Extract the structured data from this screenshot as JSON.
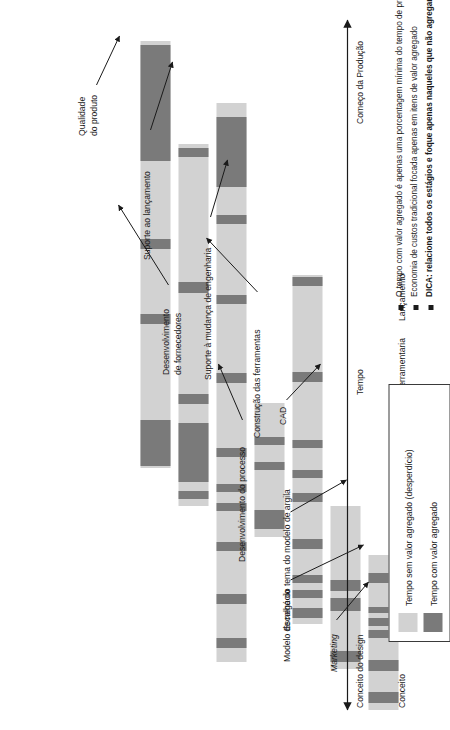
{
  "chart_data": {
    "type": "bar",
    "title": "",
    "xlabel": "Tempo",
    "ylabel": "",
    "orientation": "horizontal-timeline",
    "axis": {
      "left_label": "Conceito do design",
      "middle_label": "Tempo",
      "right_label": "Começo da Produção",
      "double_headed": true
    },
    "categories": [
      "Conceito",
      "Estilo",
      "Projeto com CAD",
      "Protótipo",
      "Engenharia de produção",
      "Ferramentaria",
      "Lançamento"
    ],
    "legend": {
      "position": "bottom-right",
      "entries": [
        {
          "label": "Tempo sem valor agregado (desperdício)",
          "color": "#d2d2d2"
        },
        {
          "label": "Tempo com valor agregado",
          "color": "#7a7a7a"
        }
      ]
    },
    "series": [
      {
        "name": "Tempo sem valor agregado (desperdício)",
        "color": "#d2d2d2"
      },
      {
        "name": "Tempo com valor agregado",
        "color": "#7a7a7a"
      }
    ],
    "bars": [
      {
        "category": "Conceito",
        "start_pct": 0.0,
        "end_pct": 22.5,
        "value_added_segments_pct": [
          [
            1.0,
            2.6
          ],
          [
            5.6,
            7.2
          ],
          [
            10.4,
            11.6
          ],
          [
            12.2,
            13.4
          ],
          [
            14.0,
            15.0
          ],
          [
            18.4,
            19.8
          ]
        ]
      },
      {
        "category": "Estilo",
        "start_pct": 6.0,
        "end_pct": 29.5,
        "value_added_segments_pct": [
          [
            7.0,
            8.6
          ],
          [
            14.4,
            16.2
          ],
          [
            17.2,
            18.8
          ]
        ]
      },
      {
        "category": "Projeto com CAD",
        "start_pct": 12.5,
        "end_pct": 63.0,
        "value_added_segments_pct": [
          [
            13.4,
            14.8
          ],
          [
            16.2,
            17.4
          ],
          [
            18.4,
            19.6
          ],
          [
            23.4,
            24.8
          ],
          [
            30.2,
            31.4
          ],
          [
            33.6,
            34.8
          ],
          [
            38.0,
            39.2
          ],
          [
            47.6,
            49.0
          ],
          [
            61.4,
            62.8
          ]
        ]
      },
      {
        "category": "Protótipo",
        "start_pct": 25.0,
        "end_pct": 44.5,
        "value_added_segments_pct": [
          [
            26.2,
            29.0
          ],
          [
            34.8,
            36.0
          ],
          [
            38.4,
            39.6
          ]
        ]
      },
      {
        "category": "Engenharia de produção",
        "start_pct": 7.0,
        "end_pct": 88.0,
        "value_added_segments_pct": [
          [
            9.0,
            10.4
          ],
          [
            15.4,
            16.8
          ],
          [
            23.0,
            24.4
          ],
          [
            28.8,
            30.0
          ],
          [
            31.6,
            32.8
          ],
          [
            36.6,
            38.0
          ],
          [
            47.4,
            48.8
          ],
          [
            58.8,
            60.2
          ],
          [
            70.4,
            71.8
          ],
          [
            75.8,
            86.0
          ]
        ]
      },
      {
        "category": "Ferramentaria",
        "start_pct": 29.5,
        "end_pct": 82.0,
        "value_added_segments_pct": [
          [
            30.6,
            31.8
          ],
          [
            33.0,
            41.6
          ],
          [
            44.4,
            45.8
          ],
          [
            60.4,
            62.0
          ],
          [
            80.2,
            81.4
          ]
        ]
      },
      {
        "category": "Lançamento",
        "start_pct": 35.0,
        "end_pct": 97.0,
        "value_added_segments_pct": [
          [
            35.4,
            42.0
          ],
          [
            56.0,
            57.4
          ],
          [
            66.8,
            68.2
          ],
          [
            79.6,
            96.4
          ]
        ]
      }
    ],
    "annotations": [
      {
        "text": "Marketing",
        "italic": true,
        "points_to": "Conceito"
      },
      {
        "text": "Modelo de negócio",
        "italic": false,
        "points_to": "Conceito"
      },
      {
        "text": "Escolha do tema do modelo de argila",
        "italic": false,
        "points_to": "Estilo"
      },
      {
        "text": "CAD",
        "italic": false,
        "points_to": "Projeto com CAD"
      },
      {
        "text": "Suporte à mudança de engenharia",
        "italic": false,
        "points_to": "Projeto com CAD"
      },
      {
        "text": "Suporte ao lançamento",
        "italic": false,
        "points_to": "Engenharia de produção"
      },
      {
        "text": "Qualidade do produto",
        "italic": false,
        "points_to": "Lançamento"
      },
      {
        "text": "Desenvolvimento de fornecedores",
        "italic": false,
        "points_to": "Engenharia de produção"
      },
      {
        "text": "Desenvolvimento do processo",
        "italic": false,
        "points_to": "Engenharia de produção"
      },
      {
        "text": "Construção das ferramentas",
        "italic": false,
        "points_to": "Ferramentaria"
      }
    ],
    "notes": [
      {
        "text": "O tempo com valor agregado é apenas uma porcentagem mínima do tempo de processamento",
        "bold": false
      },
      {
        "text": "Economia de custos tradicional focada apenas em itens de valor agregado",
        "bold": false
      },
      {
        "text": "DICA: relacione todos os estágios e foque apenas naqueles que não agregam valor!",
        "bold": true
      }
    ]
  },
  "stage_labels": {
    "conceito": "Conceito",
    "estilo": "Estilo",
    "projeto_cad_l1": "Projeto",
    "projeto_cad_l2": "com CAD",
    "prototipo": "Protótipo",
    "engenharia_l1": "Engenharia",
    "engenharia_l2": "de produção",
    "ferramentaria": "Ferramentaria",
    "lancamento": "Lançamento"
  },
  "annotation_labels": {
    "marketing": "Marketing",
    "modelo_negocio": "Modelo de negócio",
    "escolha_tema": "Escolha do tema do modelo de argila",
    "cad": "CAD",
    "suporte_mudanca": "Suporte à mudança de engenharia",
    "suporte_lancamento": "Suporte ao lançamento",
    "qualidade_l1": "Qualidade",
    "qualidade_l2": "do produto",
    "desenv_forn_l1": "Desenvolvimento",
    "desenv_forn_l2": "de fornecedores",
    "desenv_processo": "Desenvolvimento do processo",
    "construcao_ferramentas": "Construção das ferramentas"
  },
  "axis": {
    "left": "Conceito do design",
    "middle": "Tempo",
    "right": "Começo da Produção"
  },
  "legend": {
    "item1": "Tempo sem valor agregado (desperdício)",
    "item2": "Tempo com valor agregado",
    "color_light": "#d2d2d2",
    "color_dark": "#7a7a7a"
  },
  "notes": {
    "n1": "O tempo com valor agregado é apenas uma porcentagem mínima do tempo de processamento",
    "n2": "Economia de custos tradicional focada apenas em itens de valor agregado",
    "n3": "DICA: relacione todos os estágios e foque apenas naqueles que não agregam valor!"
  }
}
